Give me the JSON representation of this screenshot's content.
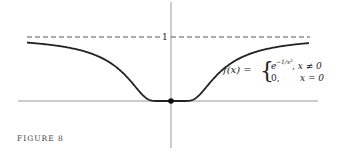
{
  "figure": {
    "caption": "FIGURE 8",
    "asymptote_label": "1",
    "formula": {
      "lhs": "f(x) =",
      "case1_expr": "e",
      "case1_exp": "−1/x²",
      "case1_cond": ", x ≠ 0",
      "case2_expr": "0,",
      "case2_cond": "x = 0"
    }
  },
  "chart_data": {
    "type": "line",
    "title": "",
    "function": "f(x) = e^(-1/x^2) for x != 0, 0 for x = 0",
    "xlim": [
      -3.3,
      3.0
    ],
    "ylim": [
      0,
      1.3
    ],
    "asymptote_y": 1,
    "marked_point": [
      0,
      0
    ],
    "xlabel": "",
    "ylabel": "",
    "grid": false,
    "colors": {
      "curve": "#222222",
      "axis": "#999999",
      "dashed": "#555555"
    }
  }
}
